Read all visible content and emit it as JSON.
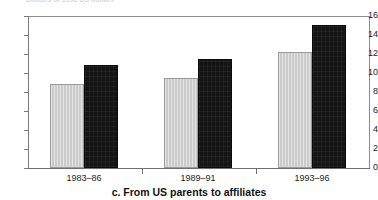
{
  "chart_data": {
    "type": "bar",
    "title": "",
    "clipped_top_caption": "Billions of 1992 US dollars",
    "caption": "c. From US parents to affiliates",
    "categories": [
      "1983–86",
      "1989–91",
      "1993–96"
    ],
    "series": [
      {
        "name": "light-series",
        "color": "#d2d2d2",
        "values": [
          8.8,
          9.5,
          12.2
        ]
      },
      {
        "name": "dark-series",
        "color": "#141414",
        "values": [
          10.8,
          11.5,
          15.1
        ]
      }
    ],
    "xlabel": "",
    "ylabel": "",
    "ylim": [
      0,
      16
    ],
    "yticks": [
      0,
      2,
      4,
      6,
      8,
      10,
      12,
      14,
      16
    ],
    "ytick_labels": [
      "0",
      "2",
      "4",
      "6",
      "8",
      "10",
      "12",
      "14",
      "16"
    ],
    "grid": false,
    "legend": "none",
    "axis_color": "#6f6f6f",
    "frame": {
      "top_rule": true,
      "right_rule": true,
      "left_axis": true,
      "bottom_axis": true
    }
  }
}
